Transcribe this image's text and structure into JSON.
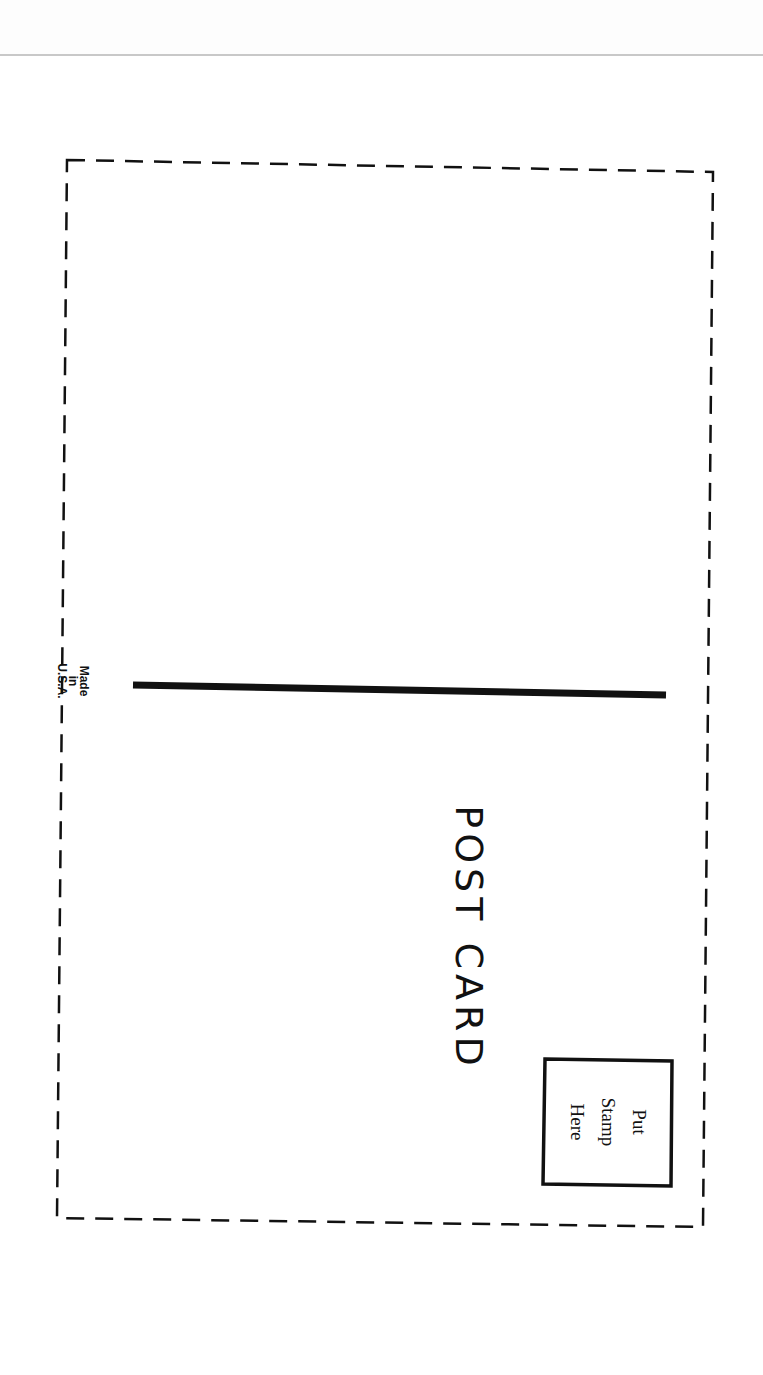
{
  "document": {
    "title": "POST CARD",
    "manufacture_note": {
      "line1": "Made",
      "line2": "in",
      "line3": "U.S.A."
    },
    "stamp_box": {
      "line1": "Put",
      "line2": "Stamp",
      "line3": "Here"
    },
    "orientation": "rotated 90° clockwise",
    "colors": {
      "ink": "#111111",
      "paper": "#ffffff",
      "header_rule": "#c8c8c8"
    }
  }
}
